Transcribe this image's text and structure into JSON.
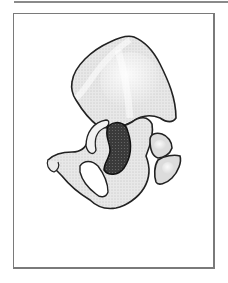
{
  "figure": {
    "colors": {
      "frame": "#7a7a7a",
      "bone_fill": "#e6e6e6",
      "bone_outline": "#2a2a2a",
      "acetabulum_fill": "#3c3c3c",
      "background": "#ffffff"
    }
  }
}
